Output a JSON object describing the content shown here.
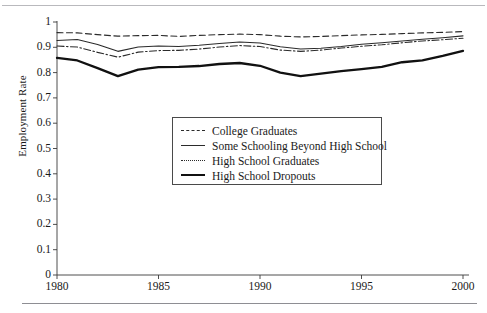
{
  "chart_data": {
    "type": "line",
    "title": "",
    "xlabel": "",
    "ylabel": "Employment Rate",
    "xlim": [
      1980,
      2000
    ],
    "ylim": [
      0,
      1
    ],
    "grid": false,
    "legend_position": "center",
    "xticks": [
      "1980",
      "1985",
      "1990",
      "1995",
      "2000"
    ],
    "yticks": [
      "0",
      "0.1",
      "0.2",
      "0.3",
      "0.4",
      "0.5",
      "0.6",
      "0.7",
      "0.8",
      "0.9",
      "1"
    ],
    "x": [
      1980,
      1981,
      1982,
      1983,
      1984,
      1985,
      1986,
      1987,
      1988,
      1989,
      1990,
      1991,
      1992,
      1993,
      1994,
      1995,
      1996,
      1997,
      1998,
      1999,
      2000
    ],
    "series": [
      {
        "name": "College Graduates",
        "style": "dashed",
        "color": "#2b2b2b",
        "width": 1.1,
        "values": [
          0.958,
          0.957,
          0.95,
          0.944,
          0.946,
          0.947,
          0.943,
          0.947,
          0.95,
          0.952,
          0.95,
          0.944,
          0.941,
          0.943,
          0.946,
          0.949,
          0.951,
          0.954,
          0.957,
          0.959,
          0.962
        ]
      },
      {
        "name": "Some Schooling Beyond High School",
        "style": "solid",
        "color": "#2b2b2b",
        "width": 1.1,
        "values": [
          0.927,
          0.931,
          0.911,
          0.884,
          0.901,
          0.905,
          0.903,
          0.908,
          0.915,
          0.921,
          0.917,
          0.902,
          0.893,
          0.896,
          0.903,
          0.912,
          0.918,
          0.925,
          0.932,
          0.938,
          0.945
        ]
      },
      {
        "name": "High School Graduates",
        "style": "dashdot",
        "color": "#2b2b2b",
        "width": 1.1,
        "values": [
          0.905,
          0.901,
          0.88,
          0.861,
          0.881,
          0.887,
          0.888,
          0.893,
          0.901,
          0.907,
          0.903,
          0.889,
          0.884,
          0.889,
          0.897,
          0.904,
          0.91,
          0.918,
          0.925,
          0.93,
          0.936
        ]
      },
      {
        "name": "High School Dropouts",
        "style": "thick",
        "color": "#111111",
        "width": 2.3,
        "values": [
          0.858,
          0.848,
          0.818,
          0.786,
          0.812,
          0.822,
          0.823,
          0.826,
          0.834,
          0.838,
          0.827,
          0.8,
          0.786,
          0.796,
          0.806,
          0.814,
          0.823,
          0.841,
          0.848,
          0.866,
          0.886
        ]
      }
    ]
  }
}
